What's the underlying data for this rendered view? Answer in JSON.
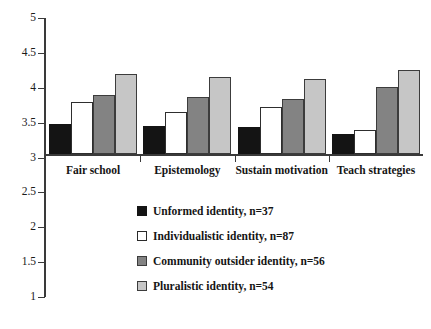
{
  "chart_data": {
    "type": "bar",
    "title": "",
    "subtitle": "",
    "xlabel": "",
    "ylabel": "",
    "ylim": [
      1,
      5
    ],
    "ytick_labels": [
      "5",
      "4.5",
      "4",
      "3.5",
      "3",
      "2.5",
      "2",
      "1.5",
      "1"
    ],
    "ytick_values": [
      5,
      4.5,
      4,
      3.5,
      3,
      2.5,
      2,
      1.5,
      1
    ],
    "baseline": 3,
    "grid": false,
    "legend_position": "below-center",
    "categories": [
      "Fair school",
      "Epistemology",
      "Sustain motivation",
      "Teach strategies"
    ],
    "series": [
      {
        "name": "Unformed identity, n=37",
        "short_name": "Unformed identity",
        "n": 37,
        "color": "#141414",
        "values": [
          3.48,
          3.45,
          3.44,
          3.33
        ]
      },
      {
        "name": "Individualistic identity, n=87",
        "short_name": "Individualistic identity",
        "n": 87,
        "color": "#ffffff",
        "values": [
          3.8,
          3.65,
          3.73,
          3.4
        ]
      },
      {
        "name": "Community outsider identity, n=56",
        "short_name": "Community outsider identity",
        "n": 56,
        "color": "#838383",
        "values": [
          3.9,
          3.87,
          3.84,
          4.01
        ]
      },
      {
        "name": "Pluralistic identity, n=54",
        "short_name": "Pluralistic identity",
        "n": 54,
        "color": "#c6c6c6",
        "values": [
          4.2,
          4.15,
          4.12,
          4.25
        ]
      }
    ]
  },
  "axis": {
    "color": "#3a3a3a"
  }
}
